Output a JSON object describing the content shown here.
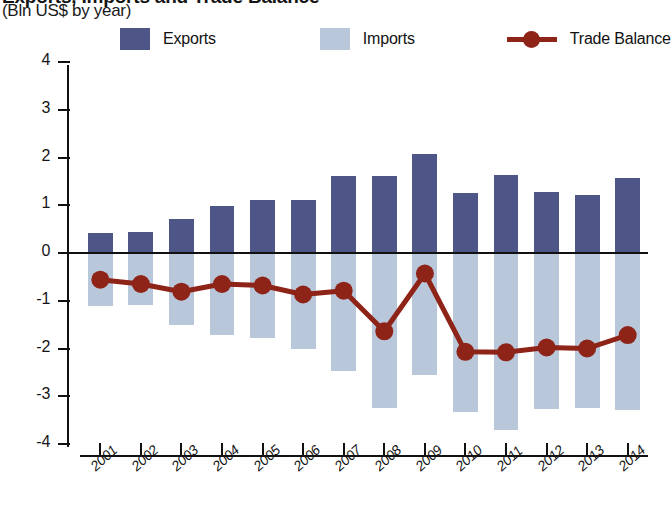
{
  "header": {
    "title_clipped": "Exports, Imports and Trade Balance",
    "subtitle": "(Bln US$ by year)"
  },
  "legend": {
    "items": [
      {
        "label": "Exports",
        "marker": "square-swatch",
        "color": "#4e5688"
      },
      {
        "label": "Imports",
        "marker": "square-swatch",
        "color": "#b9c7da"
      },
      {
        "label": "Trade Balance",
        "marker": "line-with-circle",
        "color": "#8e2317"
      }
    ]
  },
  "axes": {
    "y_ticks": [
      "4",
      "3",
      "2",
      "1",
      "0",
      "-1",
      "-2",
      "-3",
      "-4"
    ],
    "x_ticks": [
      "2001",
      "2002",
      "2003",
      "2004",
      "2005",
      "2006",
      "2007",
      "2008",
      "2009",
      "2010",
      "2011",
      "2012",
      "2013",
      "2014"
    ]
  },
  "chart_data": {
    "type": "bar",
    "title": "Exports, Imports and Trade Balance",
    "subtitle": "(Bln US$ by year)",
    "xlabel": "",
    "ylabel": "Bln US$",
    "ylim": [
      -4,
      4
    ],
    "ytick_values": [
      4,
      3,
      2,
      1,
      0,
      -1,
      -2,
      -3,
      -4
    ],
    "grid": false,
    "legend_position": "top",
    "categories": [
      "2001",
      "2002",
      "2003",
      "2004",
      "2005",
      "2006",
      "2007",
      "2008",
      "2009",
      "2010",
      "2011",
      "2012",
      "2013",
      "2014"
    ],
    "series": [
      {
        "name": "Exports",
        "type": "bar",
        "color": "#4e5688",
        "values": [
          0.42,
          0.43,
          0.72,
          0.98,
          1.1,
          1.12,
          1.62,
          1.61,
          2.08,
          1.25,
          1.63,
          1.28,
          1.22,
          1.57
        ]
      },
      {
        "name": "Imports",
        "type": "bar",
        "color": "#b9c7da",
        "values": [
          -1.1,
          -1.09,
          -1.5,
          -1.71,
          -1.79,
          -2.01,
          -2.47,
          -3.24,
          -2.55,
          -3.33,
          -3.7,
          -3.26,
          -3.25,
          -3.28
        ]
      },
      {
        "name": "Trade Balance",
        "type": "line",
        "color": "#8e2317",
        "values": [
          -0.56,
          -0.65,
          -0.81,
          -0.65,
          -0.68,
          -0.87,
          -0.79,
          -1.64,
          -0.43,
          -2.07,
          -2.08,
          -1.98,
          -2.0,
          -1.72
        ]
      }
    ]
  }
}
